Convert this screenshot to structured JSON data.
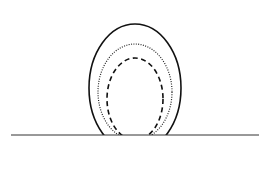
{
  "diagram": {
    "caption": "",
    "baseline": {
      "x1": 11,
      "x2": 259,
      "y": 135,
      "color": "#333333"
    },
    "shapes": [
      {
        "name": "outer-solid-contour",
        "style": "solid",
        "cx": 135,
        "cy": 88,
        "rx": 46,
        "ry": 64,
        "color": "#111111"
      },
      {
        "name": "middle-dotted-contour",
        "style": "dotted",
        "cx": 135,
        "cy": 92,
        "rx": 37,
        "ry": 48,
        "color": "#222222"
      },
      {
        "name": "inner-dashed-contour",
        "style": "dashed",
        "cx": 135,
        "cy": 99,
        "rx": 28,
        "ry": 41,
        "color": "#111111"
      }
    ]
  }
}
